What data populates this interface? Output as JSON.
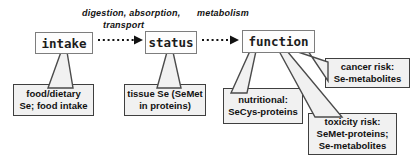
{
  "labels": {
    "digestion_absorption": "digestion, absorption,",
    "transport": "transport",
    "metabolism": "metabolism"
  },
  "main_boxes": [
    {
      "label": "intake"
    },
    {
      "label": "status"
    },
    {
      "label": "function"
    }
  ],
  "sub_boxes": [
    {
      "lines": [
        "food/dietary",
        "Se; food intake"
      ]
    },
    {
      "lines": [
        "tissue Se (SeMet",
        "in proteins)"
      ]
    },
    {
      "lines": [
        "nutritional:",
        "SeCys-proteins"
      ]
    },
    {
      "lines": [
        "toxicity risk:",
        "SeMet-proteins;",
        "Se-metabolites"
      ]
    },
    {
      "lines": [
        "cancer risk:",
        "Se-metabolites"
      ]
    }
  ],
  "icons": {
    "arrow_intake_status": "dotted-arrow-right",
    "arrow_status_function": "dotted-arrow-right"
  },
  "colors": {
    "background": "#ffffff",
    "main_box_border": "#7d7d7d",
    "main_box_fill": "#fdfdfd",
    "sub_box_border": "#3f3f3f",
    "sub_box_fill": "#f1f1f1",
    "text": "#111111",
    "arrow": "#121212"
  }
}
